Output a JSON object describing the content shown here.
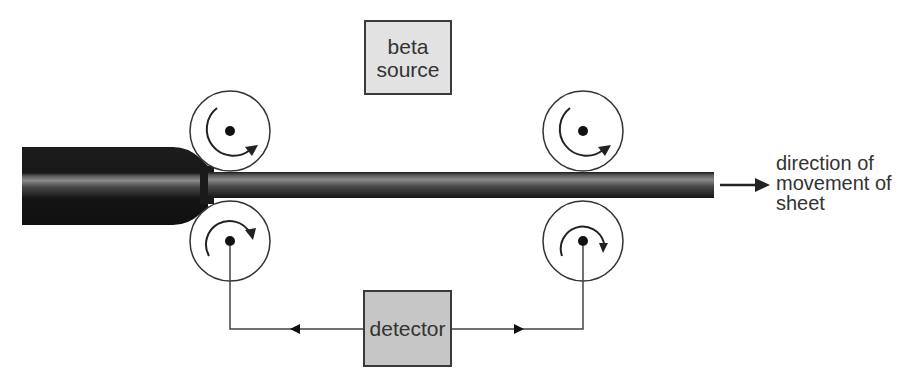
{
  "diagram": {
    "labels": {
      "beta_source_line1": "beta",
      "beta_source_line2": "source",
      "detector": "detector",
      "direction_line1": "direction of",
      "direction_line2": "movement of",
      "direction_line3": "sheet"
    },
    "components": [
      {
        "id": "roller-top-left",
        "type": "roller",
        "rotation": "clockwise"
      },
      {
        "id": "roller-bottom-left",
        "type": "roller",
        "rotation": "clockwise"
      },
      {
        "id": "roller-top-right",
        "type": "roller",
        "rotation": "clockwise"
      },
      {
        "id": "roller-bottom-right",
        "type": "roller",
        "rotation": "clockwise"
      },
      {
        "id": "sheet",
        "type": "metal-sheet",
        "thick_end": "left",
        "thin_end": "right"
      },
      {
        "id": "beta-source",
        "type": "box"
      },
      {
        "id": "detector",
        "type": "box"
      }
    ],
    "colors": {
      "sheet_dark": "#141414",
      "sheet_mid": "#7a7a7a",
      "beta_box": "#e2e2e2",
      "detector_box": "#c6c6c6",
      "line": "#3a3a3a"
    }
  }
}
